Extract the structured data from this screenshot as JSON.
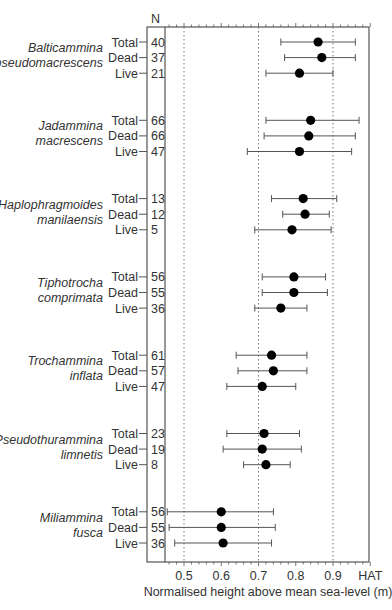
{
  "chart_data": {
    "type": "scatter",
    "subtype": "dot-with-error-bars",
    "title": "",
    "xlabel": "Normalised height above mean sea-level (m)",
    "ylabel": "",
    "n_column_header": "N",
    "xlim": [
      0.45,
      1.0
    ],
    "x_ticks": [
      {
        "value": 0.5,
        "label": "0.5"
      },
      {
        "value": 0.6,
        "label": "0.6"
      },
      {
        "value": 0.7,
        "label": "0.7"
      },
      {
        "value": 0.8,
        "label": "0.8"
      },
      {
        "value": 0.9,
        "label": "0.9"
      },
      {
        "value": 1.0,
        "label": "HAT"
      }
    ],
    "dotted_reference_lines": [
      0.5,
      0.7,
      0.9
    ],
    "grid": false,
    "legend": null,
    "groups": [
      {
        "species_line1": "Balticammina",
        "species_line2": "pseudomacrescens",
        "rows": [
          {
            "label": "Total",
            "n": "40",
            "mean": 0.86,
            "low": 0.76,
            "high": 0.96
          },
          {
            "label": "Dead",
            "n": "37",
            "mean": 0.87,
            "low": 0.77,
            "high": 0.96
          },
          {
            "label": "Live",
            "n": "21",
            "mean": 0.81,
            "low": 0.72,
            "high": 0.9
          }
        ]
      },
      {
        "species_line1": "Jadammina",
        "species_line2": "macrescens",
        "rows": [
          {
            "label": "Total",
            "n": "66",
            "mean": 0.84,
            "low": 0.72,
            "high": 0.97
          },
          {
            "label": "Dead",
            "n": "66",
            "mean": 0.835,
            "low": 0.715,
            "high": 0.96
          },
          {
            "label": "Live",
            "n": "47",
            "mean": 0.81,
            "low": 0.67,
            "high": 0.95
          }
        ]
      },
      {
        "species_line1": "Haplophragmoides",
        "species_line2": "manilaensis",
        "rows": [
          {
            "label": "Total",
            "n": "13",
            "mean": 0.82,
            "low": 0.735,
            "high": 0.91
          },
          {
            "label": "Dead",
            "n": "12",
            "mean": 0.825,
            "low": 0.765,
            "high": 0.89
          },
          {
            "label": "Live",
            "n": "5",
            "mean": 0.79,
            "low": 0.69,
            "high": 0.895
          }
        ]
      },
      {
        "species_line1": "Tiphotrocha",
        "species_line2": "comprimata",
        "rows": [
          {
            "label": "Total",
            "n": "56",
            "mean": 0.795,
            "low": 0.71,
            "high": 0.88
          },
          {
            "label": "Dead",
            "n": "55",
            "mean": 0.795,
            "low": 0.71,
            "high": 0.885
          },
          {
            "label": "Live",
            "n": "36",
            "mean": 0.76,
            "low": 0.69,
            "high": 0.83
          }
        ]
      },
      {
        "species_line1": "Trochammina",
        "species_line2": "inflata",
        "rows": [
          {
            "label": "Total",
            "n": "61",
            "mean": 0.735,
            "low": 0.64,
            "high": 0.83
          },
          {
            "label": "Dead",
            "n": "57",
            "mean": 0.74,
            "low": 0.645,
            "high": 0.83
          },
          {
            "label": "Live",
            "n": "47",
            "mean": 0.71,
            "low": 0.615,
            "high": 0.8
          }
        ]
      },
      {
        "species_line1": "Pseudothurammina",
        "species_line2": "limnetis",
        "rows": [
          {
            "label": "Total",
            "n": "23",
            "mean": 0.715,
            "low": 0.615,
            "high": 0.81
          },
          {
            "label": "Dead",
            "n": "19",
            "mean": 0.71,
            "low": 0.605,
            "high": 0.815
          },
          {
            "label": "Live",
            "n": "8",
            "mean": 0.72,
            "low": 0.66,
            "high": 0.785
          }
        ]
      },
      {
        "species_line1": "Miliammina",
        "species_line2": "fusca",
        "rows": [
          {
            "label": "Total",
            "n": "56",
            "mean": 0.6,
            "low": 0.455,
            "high": 0.74
          },
          {
            "label": "Dead",
            "n": "55",
            "mean": 0.6,
            "low": 0.46,
            "high": 0.745
          },
          {
            "label": "Live",
            "n": "36",
            "mean": 0.605,
            "low": 0.475,
            "high": 0.735
          }
        ]
      }
    ]
  }
}
